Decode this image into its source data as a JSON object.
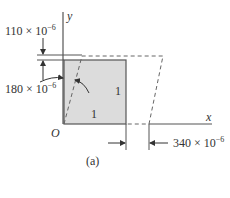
{
  "figure": {
    "caption": "(a)",
    "axes": {
      "x_label": "x",
      "y_label": "y",
      "origin_label": "O"
    },
    "square": {
      "side_labels": [
        "1",
        "1"
      ],
      "fill": "#dcdcdc",
      "stroke": "#555555"
    },
    "dimensions": {
      "top_offset": {
        "base": "110 × 10",
        "exp": "−6"
      },
      "left_angle": {
        "base": "180 × 10",
        "exp": "−6"
      },
      "right_offset": {
        "base": "340 × 10",
        "exp": "−6"
      }
    }
  }
}
